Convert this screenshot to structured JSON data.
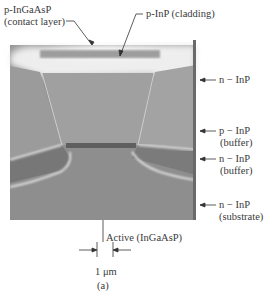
{
  "figure": {
    "caption": "(a)",
    "scale_bar_label": "1 μm",
    "labels": {
      "contact_layer": {
        "line1": "p-InGaAsP",
        "line2": "(contact layer)"
      },
      "cladding": "p-InP (cladding)",
      "n_inp_top": "n − InP",
      "p_inp_buffer": {
        "line1": "p − InP",
        "line2": "(buffer)"
      },
      "n_inp_buffer": {
        "line1": "n − InP",
        "line2": "(buffer)"
      },
      "n_inp_substrate": {
        "line1": "n − InP",
        "line2": "(substrate)"
      },
      "active": "Active (InGaAsP)"
    }
  }
}
